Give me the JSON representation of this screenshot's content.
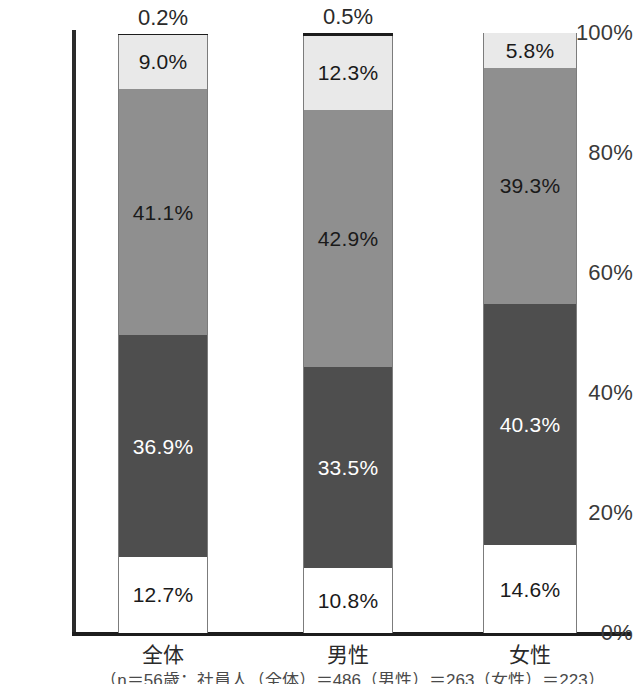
{
  "chart_data": {
    "type": "bar",
    "title": "",
    "subtitle": "",
    "xlabel": "",
    "ylabel": "",
    "ylim": [
      0,
      100
    ],
    "grid": false,
    "legend": "none",
    "stacked": true,
    "stack_order": "bottom-to-top",
    "categories": [
      "全体",
      "男性",
      "女性"
    ],
    "series": [
      {
        "name": "segment-1-bottom",
        "values": [
          12.7,
          10.8,
          14.6
        ],
        "color": "#ffffff",
        "label_color": "#1a1a1a"
      },
      {
        "name": "segment-2",
        "values": [
          36.9,
          33.5,
          40.3
        ],
        "color": "#4e4e4e",
        "label_color": "#ffffff"
      },
      {
        "name": "segment-3",
        "values": [
          41.1,
          42.9,
          39.3
        ],
        "color": "#8f8f8f",
        "label_color": "#1a1a1a"
      },
      {
        "name": "segment-4",
        "values": [
          9.0,
          12.3,
          5.8
        ],
        "color": "#e9e9e9",
        "label_color": "#1a1a1a"
      },
      {
        "name": "segment-5-top",
        "values": [
          0.2,
          0.5,
          0.0
        ],
        "color": "#1c1c1c",
        "label_color": "#2a2a2a"
      }
    ],
    "yticks": [
      "0%",
      "20%",
      "40%",
      "60%",
      "80%",
      "100%"
    ],
    "ytick_values": [
      0,
      20,
      40,
      60,
      80,
      100
    ],
    "data_labels": {
      "全体": [
        "12.7%",
        "36.9%",
        "41.1%",
        "9.0%",
        "0.2%"
      ],
      "男性": [
        "10.8%",
        "33.5%",
        "42.9%",
        "12.3%",
        "0.5%"
      ],
      "女性": [
        "14.6%",
        "40.3%",
        "39.3%",
        "5.8%",
        ""
      ]
    }
  },
  "axis": {
    "yticks": [
      {
        "label": "100%",
        "value": 100
      },
      {
        "label": "80%",
        "value": 80
      },
      {
        "label": "60%",
        "value": 60
      },
      {
        "label": "40%",
        "value": 40
      },
      {
        "label": "20%",
        "value": 20
      },
      {
        "label": "0%",
        "value": 0
      }
    ]
  },
  "bars": [
    {
      "category": "全体",
      "segments": [
        {
          "label": "0.2%",
          "value": 0.2,
          "style": "fill-top",
          "text": "dark",
          "outside": true
        },
        {
          "label": "9.0%",
          "value": 9.0,
          "style": "fill-light",
          "text": "dark",
          "outside": false
        },
        {
          "label": "41.1%",
          "value": 41.1,
          "style": "fill-mid",
          "text": "dark",
          "outside": false
        },
        {
          "label": "36.9%",
          "value": 36.9,
          "style": "fill-dark",
          "text": "light",
          "outside": false
        },
        {
          "label": "12.7%",
          "value": 12.7,
          "style": "fill-white",
          "text": "dark",
          "outside": false
        }
      ]
    },
    {
      "category": "男性",
      "segments": [
        {
          "label": "0.5%",
          "value": 0.5,
          "style": "fill-top",
          "text": "dark",
          "outside": true
        },
        {
          "label": "12.3%",
          "value": 12.3,
          "style": "fill-light",
          "text": "dark",
          "outside": false
        },
        {
          "label": "42.9%",
          "value": 42.9,
          "style": "fill-mid",
          "text": "dark",
          "outside": false
        },
        {
          "label": "33.5%",
          "value": 33.5,
          "style": "fill-dark",
          "text": "light",
          "outside": false
        },
        {
          "label": "10.8%",
          "value": 10.8,
          "style": "fill-white",
          "text": "dark",
          "outside": false
        }
      ]
    },
    {
      "category": "女性",
      "segments": [
        {
          "label": "5.8%",
          "value": 5.8,
          "style": "fill-light",
          "text": "dark",
          "outside": false
        },
        {
          "label": "39.3%",
          "value": 39.3,
          "style": "fill-mid",
          "text": "dark",
          "outside": false
        },
        {
          "label": "40.3%",
          "value": 40.3,
          "style": "fill-dark",
          "text": "light",
          "outside": false
        },
        {
          "label": "14.6%",
          "value": 14.6,
          "style": "fill-white",
          "text": "dark",
          "outside": false
        }
      ]
    }
  ],
  "footnote": "（n＝56歳：社員人（全体）＝486（男性）＝263（女性）＝223）"
}
